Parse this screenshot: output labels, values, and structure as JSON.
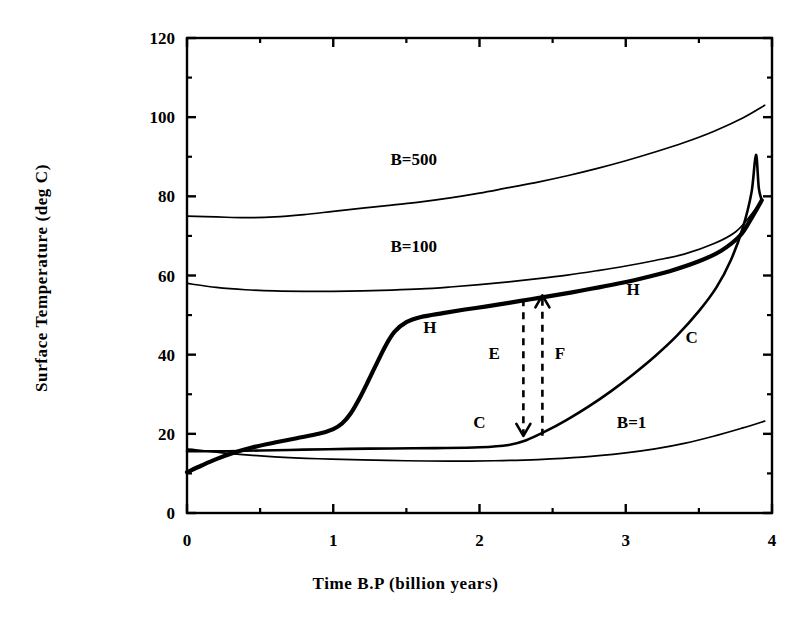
{
  "chart_data": {
    "type": "line",
    "title": "",
    "xlabel": "Time B.P (billion years)",
    "ylabel": "Surface Temperature (deg C)",
    "xlim": [
      0,
      4
    ],
    "ylim": [
      0,
      120
    ],
    "xticks": [
      0,
      1,
      2,
      3,
      4
    ],
    "xtick_labels": [
      "0",
      "1",
      "2",
      "3",
      "4"
    ],
    "xminor_ticks": [
      0.5,
      1.5,
      2.5,
      3.5
    ],
    "yticks": [
      0,
      20,
      40,
      60,
      80,
      100,
      120
    ],
    "ytick_labels": [
      "0",
      "20",
      "40",
      "60",
      "80",
      "100",
      "120"
    ],
    "yminor_ticks": [
      10,
      30,
      50,
      70,
      90,
      110
    ],
    "grid": false,
    "legend": "inline-annotations",
    "series": [
      {
        "name": "B=500",
        "label": "B=500",
        "label_x": 1.55,
        "label_y": 88,
        "width": 1.7,
        "points": [
          [
            0.0,
            75.0
          ],
          [
            0.2,
            74.8
          ],
          [
            0.4,
            74.6
          ],
          [
            0.6,
            74.8
          ],
          [
            0.8,
            75.4
          ],
          [
            1.0,
            76.2
          ],
          [
            1.2,
            77.0
          ],
          [
            1.4,
            77.8
          ],
          [
            1.6,
            78.6
          ],
          [
            1.8,
            79.6
          ],
          [
            2.0,
            80.8
          ],
          [
            2.2,
            82.2
          ],
          [
            2.4,
            83.6
          ],
          [
            2.6,
            85.2
          ],
          [
            2.8,
            87.0
          ],
          [
            3.0,
            89.0
          ],
          [
            3.2,
            91.2
          ],
          [
            3.4,
            93.6
          ],
          [
            3.6,
            96.4
          ],
          [
            3.8,
            99.8
          ],
          [
            3.95,
            103.0
          ]
        ]
      },
      {
        "name": "B=100",
        "label": "B=100",
        "label_x": 1.55,
        "label_y": 66,
        "width": 1.7,
        "points": [
          [
            0.0,
            58.0
          ],
          [
            0.2,
            57.0
          ],
          [
            0.4,
            56.4
          ],
          [
            0.6,
            56.1
          ],
          [
            0.8,
            56.0
          ],
          [
            1.0,
            56.0
          ],
          [
            1.2,
            56.1
          ],
          [
            1.4,
            56.3
          ],
          [
            1.6,
            56.6
          ],
          [
            1.8,
            57.1
          ],
          [
            2.0,
            57.7
          ],
          [
            2.2,
            58.4
          ],
          [
            2.4,
            59.2
          ],
          [
            2.6,
            60.1
          ],
          [
            2.8,
            61.2
          ],
          [
            3.0,
            62.4
          ],
          [
            3.2,
            63.8
          ],
          [
            3.4,
            65.4
          ],
          [
            3.6,
            68.0
          ],
          [
            3.75,
            71.0
          ],
          [
            3.85,
            75.0
          ],
          [
            3.93,
            79.0
          ]
        ]
      },
      {
        "name": "B=1",
        "label": "B=1",
        "label_x": 3.04,
        "label_y": 21.5,
        "width": 1.7,
        "points": [
          [
            0.0,
            16.2
          ],
          [
            0.3,
            15.0
          ],
          [
            0.6,
            14.2
          ],
          [
            0.9,
            13.7
          ],
          [
            1.2,
            13.4
          ],
          [
            1.5,
            13.2
          ],
          [
            1.8,
            13.1
          ],
          [
            2.1,
            13.2
          ],
          [
            2.4,
            13.5
          ],
          [
            2.7,
            14.1
          ],
          [
            3.0,
            15.2
          ],
          [
            3.2,
            16.2
          ],
          [
            3.4,
            17.6
          ],
          [
            3.6,
            19.4
          ],
          [
            3.8,
            21.5
          ],
          [
            3.95,
            23.2
          ]
        ]
      },
      {
        "name": "H-branch",
        "label": "H",
        "label_x": 1.66,
        "label_y": 45.5,
        "label2": "H",
        "label2_x": 3.05,
        "label2_y": 55.0,
        "width": 4.2,
        "points": [
          [
            0.0,
            10.3
          ],
          [
            0.1,
            12.0
          ],
          [
            0.2,
            13.6
          ],
          [
            0.32,
            15.2
          ],
          [
            0.45,
            16.6
          ],
          [
            0.6,
            17.8
          ],
          [
            0.75,
            18.9
          ],
          [
            0.9,
            20.0
          ],
          [
            1.0,
            21.2
          ],
          [
            1.06,
            22.6
          ],
          [
            1.12,
            25.2
          ],
          [
            1.18,
            29.0
          ],
          [
            1.24,
            33.4
          ],
          [
            1.3,
            38.0
          ],
          [
            1.36,
            42.4
          ],
          [
            1.42,
            45.8
          ],
          [
            1.5,
            48.2
          ],
          [
            1.6,
            49.5
          ],
          [
            1.75,
            50.5
          ],
          [
            1.9,
            51.4
          ],
          [
            2.05,
            52.2
          ],
          [
            2.2,
            53.1
          ],
          [
            2.35,
            54.0
          ],
          [
            2.5,
            54.9
          ],
          [
            2.7,
            56.2
          ],
          [
            2.9,
            57.6
          ],
          [
            3.1,
            59.2
          ],
          [
            3.3,
            61.1
          ],
          [
            3.5,
            63.6
          ],
          [
            3.65,
            66.2
          ],
          [
            3.78,
            70.0
          ],
          [
            3.86,
            74.5
          ],
          [
            3.93,
            79.0
          ]
        ]
      },
      {
        "name": "C-branch",
        "label": "C",
        "label_x": 2.0,
        "label_y": 21.5,
        "label2": "C",
        "label2_x": 3.45,
        "label2_y": 43.0,
        "width": 2.6,
        "points": [
          [
            0.0,
            15.6
          ],
          [
            0.25,
            15.6
          ],
          [
            0.5,
            15.8
          ],
          [
            0.8,
            16.0
          ],
          [
            1.1,
            16.2
          ],
          [
            1.4,
            16.3
          ],
          [
            1.7,
            16.4
          ],
          [
            2.0,
            16.6
          ],
          [
            2.2,
            17.2
          ],
          [
            2.32,
            18.4
          ],
          [
            2.45,
            20.6
          ],
          [
            2.6,
            23.6
          ],
          [
            2.75,
            27.0
          ],
          [
            2.9,
            30.8
          ],
          [
            3.05,
            35.0
          ],
          [
            3.2,
            39.6
          ],
          [
            3.35,
            44.8
          ],
          [
            3.5,
            51.0
          ],
          [
            3.62,
            57.0
          ],
          [
            3.72,
            64.0
          ],
          [
            3.8,
            72.0
          ],
          [
            3.86,
            81.0
          ],
          [
            3.89,
            90.5
          ],
          [
            3.91,
            82.0
          ],
          [
            3.93,
            79.0
          ]
        ]
      }
    ],
    "annotations": [
      {
        "label": "E",
        "label_x": 2.1,
        "label_y": 39.0,
        "arrow_x": 2.3,
        "arrow_from_y": 54.0,
        "arrow_to_y": 19.5,
        "direction": "down",
        "style": "dashed"
      },
      {
        "label": "F",
        "label_x": 2.55,
        "label_y": 39.0,
        "arrow_x": 2.43,
        "arrow_from_y": 19.5,
        "arrow_to_y": 55.0,
        "direction": "up",
        "style": "dashed"
      }
    ],
    "colors": {
      "ink": "#000000",
      "background": "#ffffff"
    }
  },
  "axes": {
    "x_title": "Time B.P (billion years)",
    "y_title": "Surface Temperature (deg C)"
  }
}
